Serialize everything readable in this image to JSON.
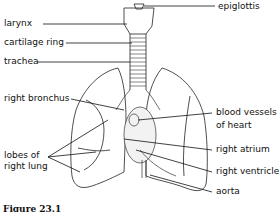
{
  "figure": {
    "caption": "Figure 23.1",
    "labels": {
      "larynx": "larynx",
      "cartilage_ring": "cartilage ring",
      "trachea": "trachea",
      "right_bronchus": "right bronchus",
      "lobes_line1": "lobes of",
      "lobes_line2": "right lung",
      "epiglottis": "epiglottis",
      "blood_vessels_line1": "blood vessels",
      "blood_vessels_line2": "of heart",
      "right_atrium": "right atrium",
      "right_ventricle": "right ventricle",
      "aorta": "aorta"
    }
  }
}
